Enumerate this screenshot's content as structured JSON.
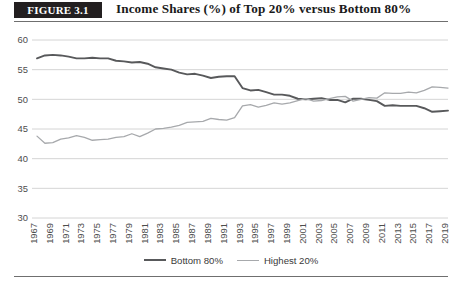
{
  "figure": {
    "badge_label": "FIGURE 3.1",
    "title": "Income Shares (%) of Top 20% versus Bottom 80%"
  },
  "legend": {
    "position": "bottom-center",
    "entries": [
      {
        "label": "Bottom 80%",
        "color": "#58595b",
        "width": 2.2
      },
      {
        "label": "Highest 20%",
        "color": "#a7a9ac",
        "width": 1.3
      }
    ]
  },
  "chart_data": {
    "type": "line",
    "title": "Income Shares (%) of Top 20% versus Bottom 80%",
    "xlabel": "",
    "ylabel": "",
    "ylim": [
      30,
      60
    ],
    "yticks": [
      30,
      35,
      40,
      45,
      50,
      55,
      60
    ],
    "grid": "horizontal",
    "legend_position": "bottom-center",
    "xlim": [
      1967,
      2019
    ],
    "xticks": [
      1967,
      1969,
      1971,
      1973,
      1975,
      1977,
      1979,
      1981,
      1983,
      1985,
      1987,
      1989,
      1991,
      1993,
      1995,
      1997,
      1999,
      2001,
      2003,
      2005,
      2007,
      2009,
      2011,
      2013,
      2015,
      2017,
      2019
    ],
    "x": [
      1967,
      1968,
      1969,
      1970,
      1971,
      1972,
      1973,
      1974,
      1975,
      1976,
      1977,
      1978,
      1979,
      1980,
      1981,
      1982,
      1983,
      1984,
      1985,
      1986,
      1987,
      1988,
      1989,
      1990,
      1991,
      1992,
      1993,
      1994,
      1995,
      1996,
      1997,
      1998,
      1999,
      2000,
      2001,
      2002,
      2003,
      2004,
      2005,
      2006,
      2007,
      2008,
      2009,
      2010,
      2011,
      2012,
      2013,
      2014,
      2015,
      2016,
      2017,
      2018,
      2019
    ],
    "series": [
      {
        "name": "Bottom 80%",
        "color": "#58595b",
        "values": [
          56.9,
          57.4,
          57.5,
          57.4,
          57.2,
          56.9,
          56.9,
          57.0,
          56.9,
          56.9,
          56.5,
          56.4,
          56.2,
          56.3,
          56.0,
          55.4,
          55.2,
          55.0,
          54.5,
          54.2,
          54.3,
          54.0,
          53.6,
          53.8,
          53.9,
          53.9,
          51.9,
          51.5,
          51.6,
          51.2,
          50.8,
          50.8,
          50.6,
          50.1,
          50.0,
          50.1,
          50.2,
          49.9,
          49.9,
          49.5,
          50.1,
          50.1,
          49.9,
          49.7,
          48.9,
          49.0,
          48.9,
          48.9,
          48.9,
          48.5,
          47.9,
          48.0,
          48.1
        ]
      },
      {
        "name": "Highest 20%",
        "color": "#a7a9ac",
        "values": [
          43.8,
          42.6,
          42.7,
          43.3,
          43.5,
          43.9,
          43.6,
          43.1,
          43.2,
          43.3,
          43.6,
          43.7,
          44.2,
          43.7,
          44.3,
          45.0,
          45.1,
          45.3,
          45.6,
          46.1,
          46.2,
          46.3,
          46.8,
          46.6,
          46.5,
          46.9,
          48.9,
          49.1,
          48.7,
          49.0,
          49.4,
          49.2,
          49.4,
          49.8,
          50.1,
          49.7,
          49.8,
          50.1,
          50.4,
          50.5,
          49.7,
          50.0,
          50.3,
          50.2,
          51.1,
          51.0,
          51.0,
          51.2,
          51.1,
          51.5,
          52.1,
          52.0,
          51.9
        ]
      }
    ]
  }
}
